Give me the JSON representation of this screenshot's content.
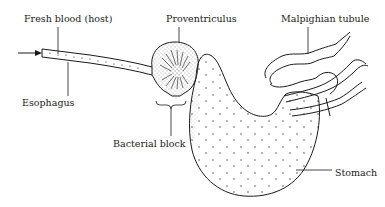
{
  "diagram": {
    "labels": {
      "fresh_blood": "Fresh blood (host)",
      "proventriculus": "Proventriculus",
      "malpighian_tubule": "Malpighian tubule",
      "esophagus": "Esophagus",
      "bacterial_block": "Bacterial block",
      "stomach": "Stomach"
    },
    "colors": {
      "line": "#1a1a1a",
      "background": "#ffffff"
    }
  }
}
